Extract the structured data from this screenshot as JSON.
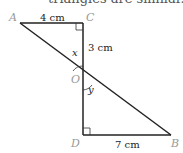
{
  "header_text": "triangles are similar.",
  "points": {
    "A": {
      "label": "A",
      "x": 20,
      "y": 23
    },
    "C": {
      "label": "C",
      "x": 83,
      "y": 23
    },
    "O": {
      "label": "O",
      "x": 83,
      "y": 78
    },
    "D": {
      "label": "D",
      "x": 83,
      "y": 135
    },
    "B": {
      "label": "B",
      "x": 171,
      "y": 135
    }
  },
  "labels": {
    "AC": "4 cm",
    "CO": "3 cm",
    "DB": "7 cm",
    "angle_x": "x",
    "angle_y": "y"
  },
  "colors": {
    "line": "#222222",
    "point_label": "#999999"
  }
}
